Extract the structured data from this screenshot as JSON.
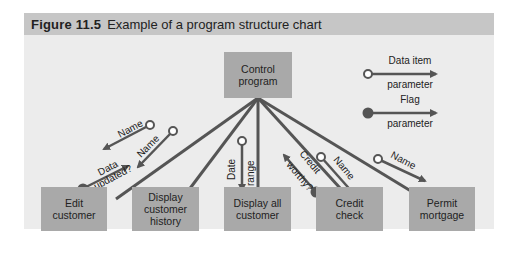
{
  "figure": {
    "number": "Figure 11.5",
    "title": "Example of a program structure chart"
  },
  "colors": {
    "header_bg": "#c6c6c6",
    "panel_bg": "#ececec",
    "box_fill": "#a9a9a9",
    "line": "#555555"
  },
  "control": {
    "label_line1": "Control",
    "label_line2": "program"
  },
  "modules": [
    {
      "line1": "Edit",
      "line2": "customer",
      "line3": ""
    },
    {
      "line1": "Display",
      "line2": "customer",
      "line3": "history"
    },
    {
      "line1": "Display all",
      "line2": "customer",
      "line3": ""
    },
    {
      "line1": "Credit",
      "line2": "check",
      "line3": ""
    },
    {
      "line1": "Permit",
      "line2": "mortgage",
      "line3": ""
    }
  ],
  "legend": {
    "data_item": {
      "line1": "Data item",
      "line2": "parameter",
      "icon": "open-circle-arrow"
    },
    "flag": {
      "line1": "Flag",
      "line2": "parameter",
      "icon": "filled-circle-arrow"
    }
  },
  "parameters": [
    {
      "label": "Name",
      "type": "data",
      "module": "Edit customer"
    },
    {
      "label": "Data updated?",
      "line1": "Data",
      "line2": "updated?",
      "type": "flag",
      "module": "Edit customer"
    },
    {
      "label": "Name",
      "type": "data",
      "module": "Display customer history"
    },
    {
      "label": "Date range",
      "line1": "Date",
      "line2": "range",
      "type": "data",
      "module": "Display all customer"
    },
    {
      "label": "Credit worthy?",
      "line1": "Credit",
      "line2": "worthy?",
      "type": "flag",
      "module": "Credit check"
    },
    {
      "label": "Name",
      "type": "data",
      "module": "Credit check"
    },
    {
      "label": "Name",
      "type": "data",
      "module": "Permit mortgage"
    }
  ]
}
